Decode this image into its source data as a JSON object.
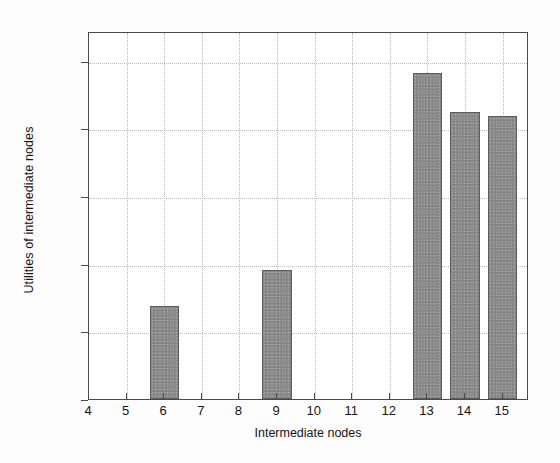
{
  "chart_data": {
    "type": "bar",
    "title": "",
    "subtitle": "",
    "xlabel": "Intermediate nodes",
    "ylabel": "Utilities of intermediate nodes",
    "categories": [
      4,
      5,
      6,
      7,
      8,
      9,
      10,
      11,
      12,
      13,
      14,
      15
    ],
    "values": [
      0,
      0,
      0.69,
      0,
      0,
      0.95,
      0,
      0,
      0,
      2.41,
      2.12,
      2.09
    ],
    "series": [
      {
        "name": "Utilities of intermediate nodes",
        "values": [
          0,
          0,
          0.69,
          0,
          0,
          0.95,
          0,
          0,
          0,
          2.41,
          2.12,
          2.09
        ]
      }
    ],
    "xlim": [
      4,
      15.7
    ],
    "ylim": [
      0,
      2.72
    ],
    "xticks": [
      "4",
      "5",
      "6",
      "7",
      "8",
      "9",
      "10",
      "11",
      "12",
      "13",
      "14",
      "15"
    ],
    "yticks": [
      "0",
      "0.5",
      "1",
      "1.5",
      "2",
      "2.5"
    ],
    "ytick_values": [
      0,
      0.5,
      1,
      1.5,
      2,
      2.5
    ],
    "grid": true,
    "grid_style": "dotted",
    "legend": null,
    "legend_position": "none",
    "bar_color": "#8c8c8c",
    "bar_edge_color": "#5d5d5d",
    "axis_color": "#4a4a4a",
    "grid_color": "#b9b9b9",
    "background_color": "#ffffff",
    "annotations": []
  },
  "figure": {
    "background": "#fdfdfd"
  }
}
